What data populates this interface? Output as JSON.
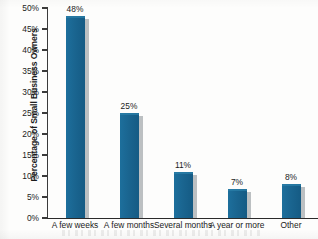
{
  "chart_data": {
    "type": "bar",
    "title": "",
    "subtitle": "",
    "xlabel": "",
    "ylabel": "Percentage of Small Business Owners",
    "categories": [
      "A few weeks",
      "A few months",
      "Several months",
      "A year or more",
      "Other"
    ],
    "values": [
      48,
      25,
      11,
      7,
      8
    ],
    "value_labels": [
      "48%",
      "25%",
      "11%",
      "7%",
      "8%"
    ],
    "ylim": [
      0,
      50
    ],
    "ytick_values": [
      0,
      5,
      10,
      15,
      20,
      25,
      30,
      35,
      40,
      45,
      50
    ],
    "ytick_labels": [
      "0%",
      "5%",
      "10%",
      "15%",
      "20%",
      "25%",
      "30%",
      "35%",
      "40%",
      "45%",
      "50%"
    ],
    "grid": false,
    "legend": false,
    "legend_position": "none",
    "series": [
      {
        "name": "Percentage of Small Business Owners",
        "values": [
          48,
          25,
          11,
          7,
          8
        ]
      }
    ],
    "colors": {
      "bar": "#1a6590",
      "bar_shadow": "#bcc0c2",
      "axis": "#2a2a2a",
      "text": "#1b1b1b",
      "background": "#fdfdfc"
    }
  }
}
